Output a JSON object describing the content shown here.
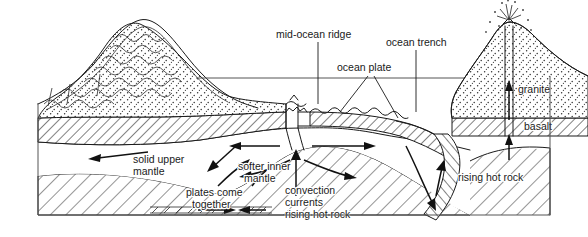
{
  "figure": {
    "background_color": "#ffffff",
    "ink_color": "#1a1a1a"
  },
  "labels": {
    "mid_ocean_ridge": "mid-ocean ridge",
    "ocean_plate": "ocean plate",
    "ocean_trench": "ocean trench",
    "granite": "granite",
    "basalt": "basalt",
    "solid_upper_mantle_line1": "solid upper",
    "solid_upper_mantle_line2": "mantle",
    "softer_inner_mantle_line1": "softer inner",
    "softer_inner_mantle_line2": "mantle",
    "plates_come_together_line1": "plates come",
    "plates_come_together_line2": "together",
    "convection_line1": "convection",
    "convection_line2": "currents",
    "convection_line3": "rising hot rock",
    "rising_hot_rock_right": "rising hot rock"
  },
  "features": {
    "sea_level_label": "sea level line",
    "mountain_range": "folded mountain range",
    "volcano": "erupting volcano",
    "subducting_slab": "subducting ocean plate",
    "spreading_center": "mid-ocean ridge spreading center"
  },
  "layers": [
    {
      "name": "granite",
      "pattern": "stipple"
    },
    {
      "name": "basalt",
      "pattern": "diagonal-hatch-dense"
    },
    {
      "name": "solid upper mantle",
      "pattern": "blank"
    },
    {
      "name": "softer inner mantle",
      "pattern": "diagonal-hatch"
    }
  ],
  "motion_arrows": [
    {
      "name": "left-plate-motion",
      "direction": "left"
    },
    {
      "name": "ridge-spread-left",
      "direction": "left"
    },
    {
      "name": "ridge-spread-right",
      "direction": "right"
    },
    {
      "name": "ridge-upwelling",
      "direction": "up"
    },
    {
      "name": "convection-left",
      "direction": "left"
    },
    {
      "name": "convection-right",
      "direction": "right"
    },
    {
      "name": "slab-descent",
      "direction": "down-right"
    },
    {
      "name": "magma-rise-volcano",
      "direction": "up"
    },
    {
      "name": "plates-converge-left",
      "direction": "right"
    },
    {
      "name": "plates-converge-right",
      "direction": "left"
    },
    {
      "name": "collision-push",
      "direction": "right"
    }
  ]
}
